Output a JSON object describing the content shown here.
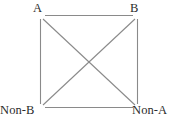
{
  "diagram": {
    "type": "square-of-opposition",
    "background_color": "#ffffff",
    "line_color": "#8a8a8a",
    "label_color": "#2b2b2b",
    "geometry": {
      "top_left": [
        41,
        16
      ],
      "top_right": [
        137,
        16
      ],
      "bottom_left": [
        41,
        107
      ],
      "bottom_right": [
        137,
        107
      ],
      "diagonal_crossing": [
        89,
        61.5
      ]
    },
    "vertices": [
      {
        "id": "top-left",
        "label": "A"
      },
      {
        "id": "top-right",
        "label": "B"
      },
      {
        "id": "bottom-left",
        "label": "Non-B"
      },
      {
        "id": "bottom-right",
        "label": "Non-A"
      }
    ],
    "edges": [
      {
        "id": "top-edge",
        "from": "top-left",
        "to": "top-right"
      },
      {
        "id": "left-edge",
        "from": "top-left",
        "to": "bottom-left"
      },
      {
        "id": "right-edge",
        "from": "top-right",
        "to": "bottom-right"
      },
      {
        "id": "bottom-edge",
        "from": "bottom-left",
        "to": "bottom-right"
      },
      {
        "id": "diagonal-tl-br",
        "from": "top-left",
        "to": "bottom-right"
      },
      {
        "id": "diagonal-tr-bl",
        "from": "top-right",
        "to": "bottom-left"
      }
    ]
  }
}
